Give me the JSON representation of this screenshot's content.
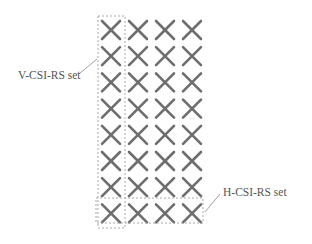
{
  "diagram": {
    "grid": {
      "rows": 8,
      "cols": 4,
      "marker": "x-mark",
      "marker_color": "#6e6e6e"
    },
    "box_color": "#a8a8a8",
    "labels": {
      "v_set": "V-CSI-RS set",
      "h_set": "H-CSI-RS set"
    }
  }
}
